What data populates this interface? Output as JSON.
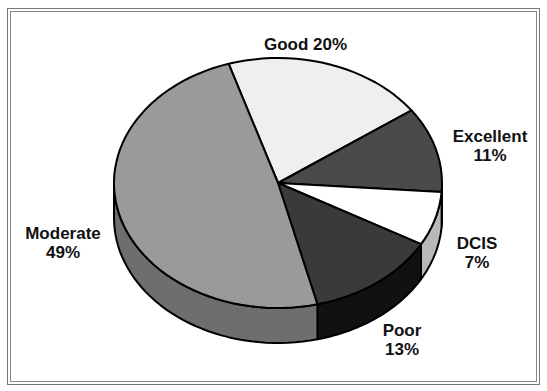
{
  "chart_data": {
    "type": "pie",
    "style": "3d",
    "title": "",
    "categories": [
      "Good",
      "Excellent",
      "DCIS",
      "Poor",
      "Moderate"
    ],
    "values": [
      20,
      11,
      7,
      13,
      49
    ],
    "unit": "%",
    "legend": "none (inline labels)",
    "colors": {
      "Good": {
        "top": "#efefef",
        "side": "#d6d6d6"
      },
      "Excellent": {
        "top": "#4a4a4a",
        "side": "#333333"
      },
      "DCIS": {
        "top": "#ffffff",
        "side": "#b8b8b8"
      },
      "Poor": {
        "top": "#3a3a3a",
        "side": "#111111"
      },
      "Moderate": {
        "top": "#9a9a9a",
        "side": "#6e6e6e"
      }
    }
  },
  "labels": {
    "good": {
      "name": "Good",
      "pct": "20%",
      "text": "Good 20%"
    },
    "excellent": {
      "name": "Excellent",
      "pct": "11%"
    },
    "dcis": {
      "name": "DCIS",
      "pct": "7%"
    },
    "poor": {
      "name": "Poor",
      "pct": "13%"
    },
    "moderate": {
      "name": "Moderate",
      "pct": "49%"
    }
  }
}
